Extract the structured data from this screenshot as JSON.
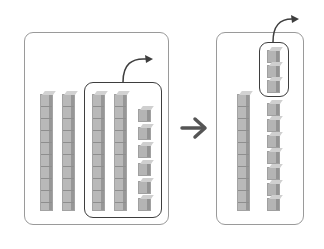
{
  "diagram": {
    "left_panel": {
      "rods": 4,
      "unit_cubes": 6,
      "highlighted": {
        "rods": 2,
        "unit_cubes": 6
      }
    },
    "transition_arrow": "right-arrow-icon",
    "right_panel": {
      "rods": 1,
      "unit_cubes": 10,
      "highlighted": {
        "unit_cubes": 3
      }
    },
    "colors": {
      "block": "#b5b5b5",
      "block_dark": "#939393",
      "panel_border": "#9a9a9a",
      "highlight_border": "#3e3e3e",
      "arrow": "#555555"
    }
  }
}
